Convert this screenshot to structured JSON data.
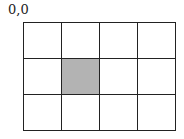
{
  "diagram": {
    "origin_label": "0,0",
    "grid": {
      "columns": 4,
      "rows": 3,
      "shaded_cells": [
        {
          "row": 1,
          "col": 1
        }
      ],
      "shade_color": "#b3b3b3",
      "line_color": "#222222"
    }
  }
}
